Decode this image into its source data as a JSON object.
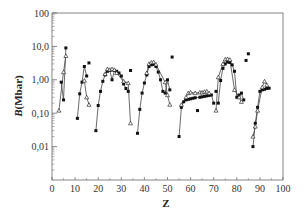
{
  "chart_data": {
    "type": "scatter",
    "title": "",
    "xlabel": "Z",
    "ylabel": "B(Mbar)",
    "xlim": [
      0,
      100
    ],
    "ylim": [
      0.001,
      100
    ],
    "yscale": "log",
    "x_ticks": [
      "0",
      "10",
      "20",
      "30",
      "40",
      "50",
      "60",
      "70",
      "80",
      "90",
      "100"
    ],
    "y_ticks": [
      {
        "value": 100,
        "label": "100"
      },
      {
        "value": 10,
        "label": "10,0"
      },
      {
        "value": 1,
        "label": "1,00"
      },
      {
        "value": 0.1,
        "label": "0,10"
      },
      {
        "value": 0.01,
        "label": "0,01"
      }
    ],
    "grid": false,
    "legend": null,
    "series": [
      {
        "name": "filled",
        "marker": "filled-square",
        "points": [
          [
            4,
            0.85
          ],
          [
            5,
            0.25
          ],
          [
            6,
            9.0
          ],
          [
            11,
            0.07
          ],
          [
            12,
            0.38
          ],
          [
            13,
            0.85
          ],
          [
            14,
            2.5
          ],
          [
            15,
            1.3
          ],
          [
            16,
            3.2
          ],
          [
            19,
            0.03
          ],
          [
            20,
            0.17
          ],
          [
            21,
            0.45
          ],
          [
            22,
            0.9
          ],
          [
            23,
            1.4
          ],
          [
            24,
            1.8
          ],
          [
            25,
            1.9
          ],
          [
            26,
            1.0
          ],
          [
            27,
            1.9
          ],
          [
            28,
            1.8
          ],
          [
            29,
            1.6
          ],
          [
            30,
            1.3
          ],
          [
            31,
            0.75
          ],
          [
            32,
            0.55
          ],
          [
            33,
            0.45
          ],
          [
            34,
            1.9
          ],
          [
            37,
            0.025
          ],
          [
            38,
            0.13
          ],
          [
            39,
            0.4
          ],
          [
            40,
            0.8
          ],
          [
            41,
            1.4
          ],
          [
            42,
            2.5
          ],
          [
            43,
            2.8
          ],
          [
            44,
            2.9
          ],
          [
            45,
            2.5
          ],
          [
            46,
            1.7
          ],
          [
            47,
            1.0
          ],
          [
            48,
            0.45
          ],
          [
            49,
            0.4
          ],
          [
            50,
            1.0
          ],
          [
            51,
            0.5
          ],
          [
            52,
            4.8
          ],
          [
            55,
            0.02
          ],
          [
            56,
            0.15
          ],
          [
            57,
            0.22
          ],
          [
            58,
            0.25
          ],
          [
            59,
            0.26
          ],
          [
            60,
            0.27
          ],
          [
            61,
            0.28
          ],
          [
            62,
            0.29
          ],
          [
            63,
            0.12
          ],
          [
            64,
            0.3
          ],
          [
            65,
            0.31
          ],
          [
            66,
            0.32
          ],
          [
            67,
            0.33
          ],
          [
            68,
            0.34
          ],
          [
            69,
            0.35
          ],
          [
            70,
            0.2
          ],
          [
            71,
            0.45
          ],
          [
            72,
            0.2
          ],
          [
            73,
            0.95
          ],
          [
            74,
            2.2
          ],
          [
            75,
            3.0
          ],
          [
            76,
            3.4
          ],
          [
            77,
            3.3
          ],
          [
            78,
            2.8
          ],
          [
            79,
            1.8
          ],
          [
            80,
            0.3
          ],
          [
            81,
            0.35
          ],
          [
            82,
            0.4
          ],
          [
            83,
            0.25
          ],
          [
            84,
            3.8
          ],
          [
            85,
            6.0
          ],
          [
            87,
            0.01
          ],
          [
            88,
            0.05
          ],
          [
            89,
            0.15
          ],
          [
            90,
            0.45
          ],
          [
            91,
            0.5
          ],
          [
            92,
            0.52
          ],
          [
            93,
            0.55
          ],
          [
            94,
            0.56
          ]
        ]
      },
      {
        "name": "open",
        "marker": "open-triangle",
        "points": [
          [
            3,
            0.12
          ],
          [
            5,
            1.7
          ],
          [
            6,
            5.2
          ],
          [
            14,
            0.95
          ],
          [
            15,
            0.3
          ],
          [
            16,
            0.18
          ],
          [
            23,
            1.5
          ],
          [
            24,
            2.1
          ],
          [
            25,
            2.0
          ],
          [
            26,
            2.1
          ],
          [
            27,
            2.0
          ],
          [
            28,
            1.6
          ],
          [
            31,
            0.9
          ],
          [
            33,
            0.8
          ],
          [
            34,
            0.05
          ],
          [
            41,
            1.6
          ],
          [
            42,
            3.0
          ],
          [
            43,
            3.3
          ],
          [
            44,
            3.4
          ],
          [
            45,
            2.9
          ],
          [
            49,
            0.85
          ],
          [
            50,
            0.35
          ],
          [
            51,
            0.18
          ],
          [
            56,
            0.18
          ],
          [
            58,
            0.3
          ],
          [
            59,
            0.4
          ],
          [
            60,
            0.42
          ],
          [
            62,
            0.4
          ],
          [
            64,
            0.42
          ],
          [
            65,
            0.42
          ],
          [
            66,
            0.44
          ],
          [
            67,
            0.45
          ],
          [
            68,
            0.4
          ],
          [
            71,
            0.12
          ],
          [
            72,
            1.2
          ],
          [
            74,
            3.0
          ],
          [
            75,
            4.1
          ],
          [
            76,
            4.2
          ],
          [
            77,
            4.0
          ],
          [
            79,
            0.5
          ],
          [
            81,
            0.3
          ],
          [
            82,
            0.22
          ],
          [
            87,
            0.02
          ],
          [
            88,
            0.04
          ],
          [
            89,
            0.12
          ],
          [
            91,
            0.6
          ],
          [
            92,
            0.9
          ],
          [
            93,
            0.7
          ]
        ]
      }
    ],
    "segments": [
      {
        "series": "filled",
        "z": [
          4,
          5,
          6
        ]
      },
      {
        "series": "filled",
        "z": [
          11,
          12,
          13,
          14,
          15
        ]
      },
      {
        "series": "filled",
        "z": [
          19,
          20,
          21,
          22,
          23,
          24,
          25,
          26,
          27,
          28,
          29,
          30,
          31,
          32,
          33
        ]
      },
      {
        "series": "filled",
        "z": [
          37,
          38,
          39,
          40,
          41,
          42,
          43,
          44,
          45,
          46,
          47,
          48,
          49,
          50,
          51
        ]
      },
      {
        "series": "filled",
        "z": [
          55,
          56,
          57,
          58,
          59,
          60,
          61,
          62,
          64,
          65,
          66,
          67,
          68,
          69,
          70
        ]
      },
      {
        "series": "filled",
        "z": [
          72,
          73,
          74,
          75,
          76,
          77,
          78,
          79,
          80,
          81,
          82,
          83
        ]
      },
      {
        "series": "filled",
        "z": [
          87,
          88,
          89,
          90,
          91,
          92,
          93,
          94
        ]
      },
      {
        "series": "open",
        "z": [
          3,
          5,
          6
        ]
      },
      {
        "series": "open",
        "z": [
          14,
          15,
          16
        ]
      },
      {
        "series": "open",
        "z": [
          23,
          24,
          25,
          26,
          27,
          28,
          31,
          33,
          34
        ]
      },
      {
        "series": "open",
        "z": [
          41,
          42,
          43,
          44,
          45,
          49,
          50,
          51
        ]
      },
      {
        "series": "open",
        "z": [
          56,
          58,
          59,
          60,
          62,
          64,
          65,
          66,
          67,
          68
        ]
      },
      {
        "series": "open",
        "z": [
          71,
          72,
          74,
          75,
          76,
          77,
          79,
          81,
          82
        ]
      },
      {
        "series": "open",
        "z": [
          87,
          88,
          89,
          91,
          92,
          93
        ]
      }
    ]
  },
  "layout": {
    "plot_left": 52,
    "plot_right": 283,
    "plot_top": 13,
    "plot_bottom": 180,
    "line_color": "#444444",
    "marker_color": "#111111",
    "axis_color": "#666666"
  }
}
